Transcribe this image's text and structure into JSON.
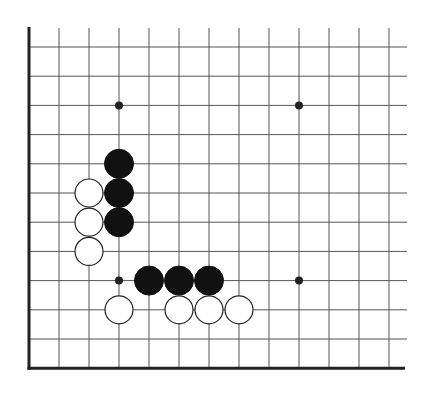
{
  "board": {
    "description": "Go board corner diagram (lower-left corner)",
    "grid": {
      "origin_x": 29,
      "origin_y": 47,
      "spacing_x": 30,
      "spacing_y": 29.2,
      "columns": 13,
      "rows": 12,
      "line_top": 28,
      "line_right": 407,
      "edge_left": true,
      "edge_bottom": true
    },
    "colors": {
      "line": "#555555",
      "edge": "#222222",
      "black_stone": "#111111",
      "white_stone": "#ffffff",
      "stone_outline": "#222222"
    },
    "star_points": [
      {
        "col": 3,
        "row": 2
      },
      {
        "col": 9,
        "row": 2
      },
      {
        "col": 3,
        "row": 8
      },
      {
        "col": 9,
        "row": 8
      }
    ],
    "black_stones": [
      {
        "col": 3,
        "row": 4
      },
      {
        "col": 3,
        "row": 5
      },
      {
        "col": 3,
        "row": 6
      },
      {
        "col": 4,
        "row": 8
      },
      {
        "col": 5,
        "row": 8
      },
      {
        "col": 6,
        "row": 8
      }
    ],
    "white_stones": [
      {
        "col": 2,
        "row": 5
      },
      {
        "col": 2,
        "row": 6
      },
      {
        "col": 2,
        "row": 7
      },
      {
        "col": 3,
        "row": 9
      },
      {
        "col": 5,
        "row": 9
      },
      {
        "col": 6,
        "row": 9
      },
      {
        "col": 7,
        "row": 9
      }
    ]
  }
}
